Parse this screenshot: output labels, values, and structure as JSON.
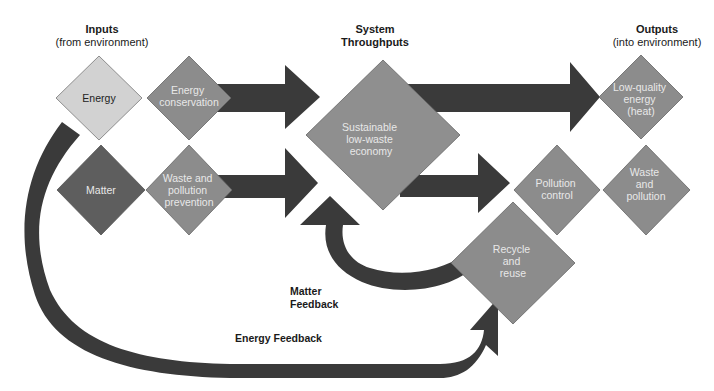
{
  "headers": {
    "inputs": {
      "title": "Inputs",
      "subtitle": "(from environment)"
    },
    "throughputs": {
      "title_line1": "System",
      "title_line2": "Throughputs"
    },
    "outputs": {
      "title": "Outputs",
      "subtitle": "(into environment)"
    }
  },
  "nodes": {
    "energy": {
      "lines": [
        "Energy"
      ]
    },
    "energy_conservation": {
      "lines": [
        "Energy",
        "conservation"
      ]
    },
    "matter": {
      "lines": [
        "Matter"
      ]
    },
    "waste_prevention": {
      "lines": [
        "Waste and",
        "pollution",
        "prevention"
      ]
    },
    "economy": {
      "lines": [
        "Sustainable",
        "low-waste",
        "economy"
      ]
    },
    "low_quality_energy": {
      "lines": [
        "Low-quality",
        "energy",
        "(heat)"
      ]
    },
    "pollution_control": {
      "lines": [
        "Pollution",
        "control"
      ]
    },
    "waste_pollution": {
      "lines": [
        "Waste",
        "and",
        "pollution"
      ]
    },
    "recycle": {
      "lines": [
        "Recycle",
        "and",
        "reuse"
      ]
    }
  },
  "feedback": {
    "matter_line1": "Matter",
    "matter_line2": "Feedback",
    "energy": "Energy Feedback"
  },
  "colors": {
    "arrow": "#3a3a3a",
    "diamond_light": "#d2d2d2",
    "diamond_mid": "#8c8c8c",
    "diamond_dark": "#5e5e5e",
    "economy": "#8f8f8f"
  }
}
